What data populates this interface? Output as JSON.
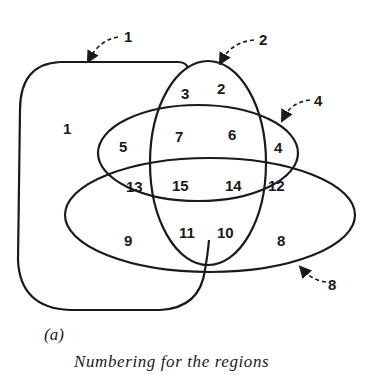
{
  "figure": {
    "tag": "(a)",
    "caption": "Numbering for the regions"
  },
  "sets": [
    {
      "id": "set-1",
      "label": "1",
      "shape": "rounded-rectangle"
    },
    {
      "id": "set-2",
      "label": "2",
      "shape": "vertical-ellipse"
    },
    {
      "id": "set-4",
      "label": "4",
      "shape": "horizontal-ellipse"
    },
    {
      "id": "set-8",
      "label": "8",
      "shape": "wide-horizontal-ellipse"
    }
  ],
  "regions": [
    {
      "label": "1"
    },
    {
      "label": "2"
    },
    {
      "label": "3"
    },
    {
      "label": "4"
    },
    {
      "label": "5"
    },
    {
      "label": "6"
    },
    {
      "label": "7"
    },
    {
      "label": "8"
    },
    {
      "label": "9"
    },
    {
      "label": "10"
    },
    {
      "label": "11"
    },
    {
      "label": "12"
    },
    {
      "label": "13"
    },
    {
      "label": "14"
    },
    {
      "label": "15"
    }
  ],
  "colors": {
    "line": "#1a1a1a",
    "background": "#ffffff"
  }
}
